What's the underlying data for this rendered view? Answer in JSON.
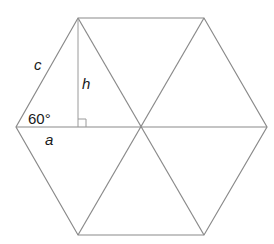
{
  "diagram": {
    "colors": {
      "stroke": "#8a8a8a",
      "text": "#1a1a1a",
      "background": "#ffffff"
    },
    "vertices": {
      "top_left": [
        78,
        18
      ],
      "top_right": [
        204,
        18
      ],
      "right": [
        267,
        127
      ],
      "bottom_right": [
        204,
        235
      ],
      "bottom_left": [
        78,
        235
      ],
      "left": [
        16,
        127
      ],
      "center": [
        141,
        127
      ]
    },
    "labels": {
      "side": "c",
      "height": "h",
      "angle": "60°",
      "base": "a"
    },
    "right_angle_marker": {
      "position": [
        78,
        127
      ],
      "size": 8
    }
  }
}
